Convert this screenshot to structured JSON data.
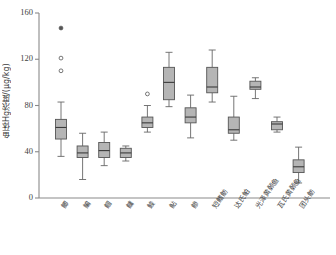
{
  "chart_data": {
    "type": "box",
    "title": "",
    "xlabel": "",
    "ylabel": "鱼体Hg浓度/(μg/kg)",
    "ylim": [
      0,
      160
    ],
    "yticks": [
      0,
      40,
      80,
      120,
      160
    ],
    "ytick_labels": [
      "0",
      "40",
      "80",
      "120",
      "160"
    ],
    "grid": false,
    "legend": false,
    "categories": [
      "鲫",
      "鳊",
      "鲴",
      "鳙",
      "鮻",
      "鲇",
      "鲹",
      "短鳍鲂",
      "达氏鲌",
      "光泽黄颡鱼",
      "瓦氏黄颡鱼",
      "团头鲂"
    ],
    "boxes": [
      {
        "category": "鲫",
        "whisker_low": 36,
        "q1": 51,
        "median": 61,
        "q3": 68,
        "whisker_high": 83,
        "outliers": [
          110,
          121
        ],
        "extremes": [
          147
        ]
      },
      {
        "category": "鳊",
        "whisker_low": 16,
        "q1": 35,
        "median": 39,
        "q3": 45,
        "whisker_high": 56,
        "outliers": [],
        "extremes": []
      },
      {
        "category": "鲴",
        "whisker_low": 28,
        "q1": 35,
        "median": 41,
        "q3": 48,
        "whisker_high": 57,
        "outliers": [],
        "extremes": []
      },
      {
        "category": "鳙",
        "whisker_low": 32,
        "q1": 35,
        "median": 39,
        "q3": 43,
        "whisker_high": 45,
        "outliers": [],
        "extremes": []
      },
      {
        "category": "鮻",
        "whisker_low": 57,
        "q1": 61,
        "median": 65,
        "q3": 70,
        "whisker_high": 80,
        "outliers": [
          90
        ],
        "extremes": []
      },
      {
        "category": "鲇",
        "whisker_low": 79,
        "q1": 85,
        "median": 100,
        "q3": 113,
        "whisker_high": 126,
        "outliers": [],
        "extremes": []
      },
      {
        "category": "鲹",
        "whisker_low": 52,
        "q1": 65,
        "median": 70,
        "q3": 78,
        "whisker_high": 89,
        "outliers": [],
        "extremes": []
      },
      {
        "category": "短鳍鲂",
        "whisker_low": 83,
        "q1": 91,
        "median": 96,
        "q3": 113,
        "whisker_high": 128,
        "outliers": [],
        "extremes": []
      },
      {
        "category": "达氏鲌",
        "whisker_low": 50,
        "q1": 56,
        "median": 59,
        "q3": 70,
        "whisker_high": 88,
        "outliers": [],
        "extremes": []
      },
      {
        "category": "光泽黄颡鱼",
        "whisker_low": 86,
        "q1": 94,
        "median": 96,
        "q3": 101,
        "whisker_high": 104,
        "outliers": [],
        "extremes": []
      },
      {
        "category": "瓦氏黄颡鱼",
        "whisker_low": 57,
        "q1": 59,
        "median": 64,
        "q3": 66,
        "whisker_high": 70,
        "outliers": [],
        "extremes": []
      },
      {
        "category": "团头鲂",
        "whisker_low": 13,
        "q1": 22,
        "median": 27,
        "q3": 33,
        "whisker_high": 44,
        "outliers": [],
        "extremes": []
      }
    ],
    "colors": {
      "box_fill": "#a8a8a8",
      "box_stroke": "#555555",
      "median_stroke": "#3a3a3a",
      "whisker_stroke": "#666666",
      "outlier_stroke": "#555555",
      "axis_stroke": "#8a8a8a",
      "text": "#3f3f3f"
    }
  }
}
